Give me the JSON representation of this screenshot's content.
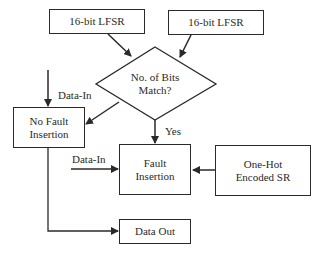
{
  "diagram": {
    "nodes": {
      "lfsr_a": {
        "label": "16-bit LFSR"
      },
      "lfsr_b": {
        "label": "16-bit LFSR"
      },
      "decision": {
        "line1": "No. of Bits",
        "line2": "Match?"
      },
      "no_fault": {
        "line1": "No Fault",
        "line2": "Insertion"
      },
      "fault": {
        "line1": "Fault",
        "line2": "Insertion"
      },
      "one_hot": {
        "line1": "One-Hot",
        "line2": "Encoded SR"
      },
      "data_out": {
        "label": "Data Out"
      }
    },
    "edge_labels": {
      "data_in_left": "Data-In",
      "data_in_fault": "Data-In",
      "yes": "Yes"
    },
    "edges": [
      {
        "from": "lfsr_a",
        "to": "decision"
      },
      {
        "from": "lfsr_b",
        "to": "decision"
      },
      {
        "from": "data_in",
        "to": "no_fault",
        "label": "Data-In"
      },
      {
        "from": "decision",
        "to": "no_fault"
      },
      {
        "from": "decision",
        "to": "fault",
        "label": "Yes"
      },
      {
        "from": "data_in",
        "to": "fault",
        "label": "Data-In"
      },
      {
        "from": "one_hot",
        "to": "fault"
      },
      {
        "from": "no_fault",
        "to": "data_out"
      }
    ],
    "colors": {
      "stroke": "#2a2a2a",
      "background": "#ffffff"
    }
  }
}
